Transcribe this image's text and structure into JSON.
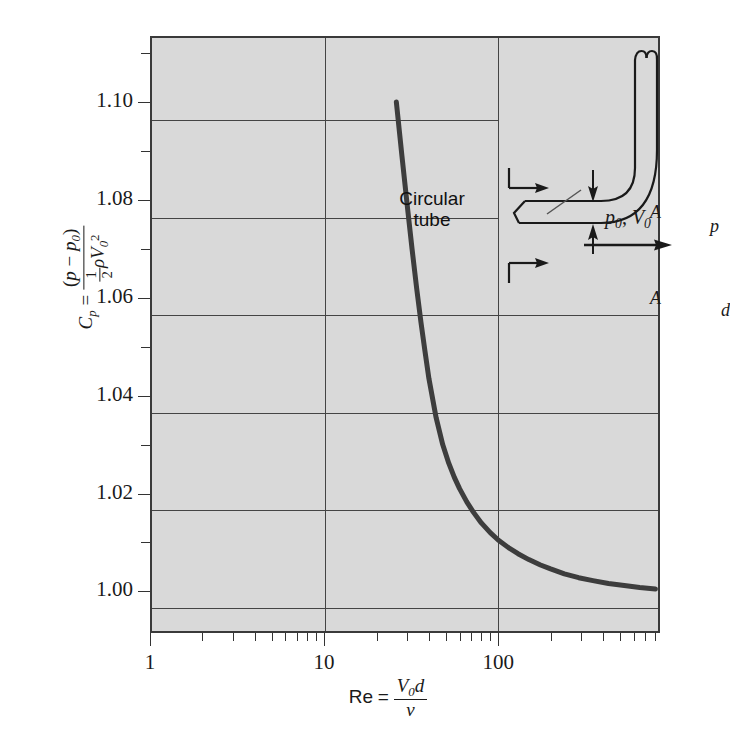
{
  "figure": {
    "background_color": "#ffffff",
    "plot_background_color": "#d9d9d9",
    "frame_color": "#3a3a3a",
    "curve_color": "#3d3d3d"
  },
  "chart_data": {
    "type": "line",
    "title": "",
    "subtitle": "",
    "xlabel": "Re = V0 d / nu",
    "ylabel": "Cp = (p - p0) / (1/2 rho V0^2)",
    "xscale": "log",
    "yscale": "linear",
    "xlim": [
      1,
      850
    ],
    "ylim": [
      0.9915,
      1.1135
    ],
    "grid": true,
    "legend": "none",
    "x_tick_labels": [
      "1",
      "10",
      "100"
    ],
    "x_tick_values": [
      1,
      10,
      100
    ],
    "x_minor_ticks": [
      2,
      3,
      4,
      5,
      6,
      7,
      8,
      9,
      20,
      30,
      40,
      50,
      60,
      70,
      80,
      90,
      200,
      300,
      400,
      500,
      600,
      700,
      800
    ],
    "y_tick_labels": [
      "1.00",
      "1.02",
      "1.04",
      "1.06",
      "1.08",
      "1.10"
    ],
    "y_tick_values": [
      1.0,
      1.02,
      1.04,
      1.06,
      1.08,
      1.1
    ],
    "y_minor_tick_values": [
      1.01,
      1.03,
      1.05,
      1.07,
      1.09,
      1.11
    ],
    "series": [
      {
        "name": "Circular tube",
        "x": [
          26,
          28,
          30,
          32,
          34,
          36,
          38,
          40,
          44,
          48,
          52,
          56,
          60,
          66,
          72,
          80,
          90,
          100,
          115,
          130,
          150,
          175,
          200,
          240,
          290,
          350,
          430,
          530,
          650,
          800
        ],
        "y": [
          1.1,
          1.089,
          1.079,
          1.07,
          1.062,
          1.055,
          1.049,
          1.0435,
          1.0355,
          1.03,
          1.0262,
          1.0233,
          1.021,
          1.0183,
          1.0162,
          1.014,
          1.012,
          1.0105,
          1.0089,
          1.0077,
          1.0065,
          1.0054,
          1.0046,
          1.0036,
          1.0028,
          1.0022,
          1.0016,
          1.0012,
          1.0008,
          1.0005
        ]
      }
    ],
    "annotations": [
      {
        "name": "curve-label",
        "text_line1": "Circular",
        "text_line2": "tube"
      },
      {
        "name": "flow-label",
        "text": "p0, V0"
      },
      {
        "name": "inset-section-top",
        "text": "A"
      },
      {
        "name": "inset-section-bottom",
        "text": "A"
      },
      {
        "name": "inset-pressure",
        "text": "p"
      },
      {
        "name": "inset-diameter",
        "text": "d"
      }
    ]
  },
  "axis": {
    "y_title": {
      "symbol": "C",
      "symbol_sub": "p",
      "equals": "=",
      "numerator": "(p − p₀)",
      "den_half_num": "1",
      "den_half_den": "2",
      "den_rho": "ρ",
      "den_V": "V",
      "den_V_sub": "0",
      "den_V_sup": "2"
    },
    "x_title": {
      "symbol": "Re",
      "equals": "=",
      "numerator_V": "V",
      "numerator_V_sub": "0",
      "numerator_d": "d",
      "denominator": "ν"
    }
  },
  "inset": {
    "name": "pitot-tube-diagram",
    "labels": {
      "section_top": "A",
      "section_bottom": "A",
      "pressure": "p",
      "diameter": "d",
      "flow": {
        "p0": "p",
        "p0_sub": "0",
        "sep": ", ",
        "V0": "V",
        "V0_sub": "0"
      }
    }
  }
}
